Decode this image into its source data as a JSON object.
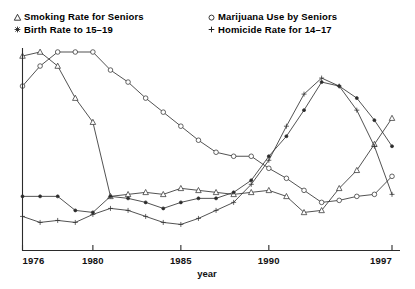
{
  "legend": {
    "columns": [
      {
        "entries": [
          {
            "marker": "triangle-up-outline-icon",
            "label": "Smoking Rate for Seniors"
          },
          {
            "marker": "star-small-icon",
            "label": "Birth Rate to 15–19"
          }
        ]
      },
      {
        "entries": [
          {
            "marker": "circle-outline-icon",
            "label": "Marijuana Use by Seniors"
          },
          {
            "marker": "plus-icon",
            "label": "Homicide Rate for 14–17"
          }
        ]
      }
    ]
  },
  "axes": {
    "x_title": "year",
    "x_ticks": [
      "1976",
      "1980",
      "1985",
      "1990",
      "1997"
    ]
  },
  "chart_data": {
    "type": "line",
    "title": "",
    "subtitle": "",
    "xlabel": "year",
    "ylabel": "",
    "xlim": [
      1976,
      1997
    ],
    "ylim": [
      0,
      100
    ],
    "grid": false,
    "y_axis_ticks_shown": false,
    "legend_position": "top",
    "x_tick_labels": [
      "1976",
      "1980",
      "1985",
      "1990",
      "1997"
    ],
    "x_tick_values": [
      1976,
      1980,
      1985,
      1990,
      1997
    ],
    "note": "Vertical axis is unlabeled; y values are index values read off the plot as percent of plot height (0 = bottom axis, 100 = top of plot area).",
    "x": [
      1976,
      1977,
      1978,
      1979,
      1980,
      1981,
      1982,
      1983,
      1984,
      1985,
      1986,
      1987,
      1988,
      1989,
      1990,
      1991,
      1992,
      1993,
      1994,
      1995,
      1996,
      1997
    ],
    "series": [
      {
        "name": "Smoking Rate for Seniors",
        "marker": "triangle-up-outline-icon",
        "marker_style": "open-triangle",
        "values": [
          97,
          99,
          92,
          76,
          64,
          27,
          28,
          29,
          28,
          31,
          30,
          29,
          28,
          29,
          30,
          27,
          19,
          20,
          31,
          40,
          53,
          66
        ]
      },
      {
        "name": "Birth Rate to 15–19",
        "marker": "star-small-icon",
        "marker_style": "solid-small",
        "values": [
          27,
          27,
          27,
          20,
          19,
          27,
          26,
          24,
          21,
          24,
          26,
          26,
          29,
          35,
          47,
          57,
          70,
          84,
          82,
          76,
          65,
          52
        ]
      },
      {
        "name": "Marijuana Use by Seniors",
        "marker": "circle-outline-icon",
        "marker_style": "open-circle",
        "values": [
          82,
          92,
          99,
          99,
          99,
          90,
          84,
          76,
          69,
          62,
          55,
          49,
          47,
          47,
          41,
          36,
          30,
          24,
          25,
          27,
          28,
          37
        ]
      },
      {
        "name": "Homicide Rate for 14–17",
        "marker": "plus-icon",
        "marker_style": "plus",
        "values": [
          17,
          14,
          15,
          14,
          18,
          21,
          20,
          17,
          14,
          13,
          16,
          20,
          24,
          33,
          45,
          62,
          78,
          86,
          82,
          70,
          52,
          28
        ]
      }
    ]
  }
}
